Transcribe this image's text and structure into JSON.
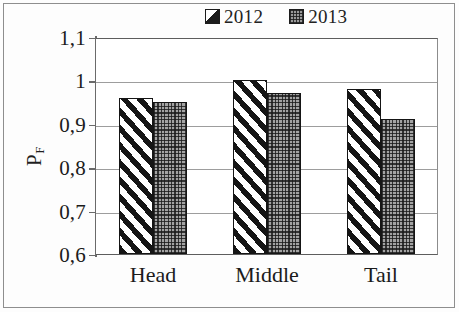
{
  "chart_data": {
    "type": "bar",
    "title": "",
    "subtitle": "",
    "xlabel": "",
    "ylabel": "P_F",
    "ylabel_base": "P",
    "ylabel_sub": "F",
    "categories": [
      "Head",
      "Middle",
      "Tail"
    ],
    "series": [
      {
        "name": "2012",
        "values": [
          0.96,
          1.0,
          0.98
        ],
        "pattern": "diagonal-stripes",
        "color": "#ffffff",
        "edge_color": "#151515"
      },
      {
        "name": "2013",
        "values": [
          0.95,
          0.97,
          0.91
        ],
        "pattern": "checkered-dots",
        "color": "#a3a3a3",
        "edge_color": "#151515"
      }
    ],
    "ylim": [
      0.6,
      1.1
    ],
    "y_ticks": [
      0.6,
      0.7,
      0.8,
      0.9,
      1.0,
      1.1
    ],
    "y_tick_labels": [
      "0,6",
      "0,7",
      "0,8",
      "0,9",
      "1",
      "1,1"
    ],
    "decimal_separator": ",",
    "grid": true,
    "grid_axis": "y",
    "legend_position": "top-center",
    "legend_entries": [
      "2012",
      "2013"
    ]
  },
  "legend": {
    "entries": [
      {
        "label": "2012",
        "swatch": "hatched-swatch-2012"
      },
      {
        "label": "2013",
        "swatch": "dotted-swatch-2013"
      }
    ]
  },
  "axes": {
    "y_title_base": "P",
    "y_title_sub": "F",
    "y_tick_labels": [
      "1,1",
      "1",
      "0,9",
      "0,8",
      "0,7",
      "0,6"
    ],
    "x_tick_labels": [
      "Head",
      "Middle",
      "Tail"
    ]
  }
}
